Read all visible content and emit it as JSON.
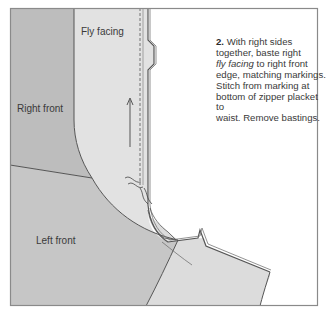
{
  "diagram": {
    "step_number": "2.",
    "instruction_lines": [
      "With right sides",
      "together, baste right",
      "fly facing",
      " to right front",
      "edge, matching markings.",
      "Stitch from marking at",
      "bottom of zipper placket to",
      "waist. Remove bastings."
    ],
    "instruction_parts": {
      "line1": "With right sides",
      "line2": "together, baste right",
      "line3_italic": "fly facing",
      "line3_rest": " to right front",
      "line4": "edge, matching markings.",
      "line5": "Stitch from marking at",
      "line6": "bottom of zipper placket to",
      "line7": "waist. Remove bastings."
    },
    "labels": {
      "fly_facing": "Fly facing",
      "right_front": "Right front",
      "left_front": "Left front"
    },
    "icons": {
      "grainline_arrow": "grainline-arrow-icon",
      "basting_marks": "basting-squiggle-icon"
    },
    "colors": {
      "right_front_fill": "#bdbdbd",
      "left_front_fill": "#c6c6c6",
      "fly_facing_fill": "#e2e2e2",
      "zipper_placket_fill": "#dadada",
      "outline": "#555555",
      "frame": "#8a8a8a",
      "background": "#ffffff",
      "text": "#3a3a3a"
    }
  }
}
